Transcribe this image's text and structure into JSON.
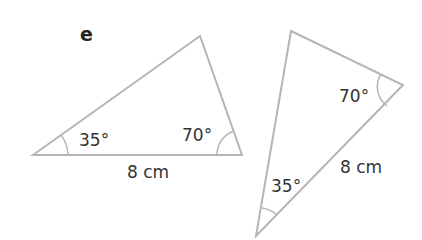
{
  "part_label": "e",
  "triangles": [
    {
      "id": "left",
      "angles": [
        "35°",
        "70°"
      ],
      "side": "8 cm"
    },
    {
      "id": "right",
      "angles": [
        "70°",
        "35°"
      ],
      "side": "8 cm"
    }
  ],
  "colors": {
    "stroke": "#b5b5b5",
    "text": "#333333"
  }
}
